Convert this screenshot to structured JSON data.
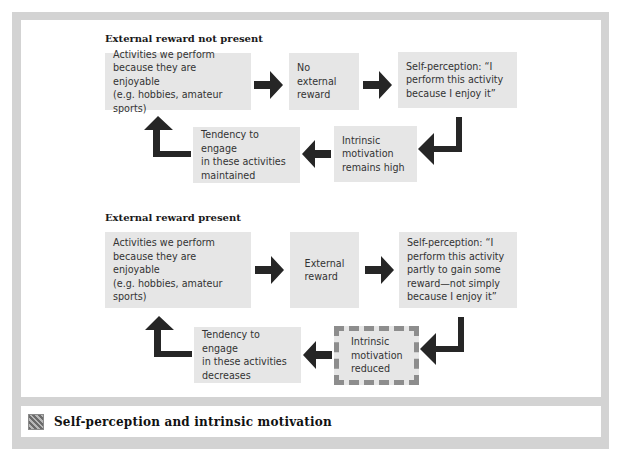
{
  "diagram": {
    "caption": {
      "icon": "photo-thumbnail-icon",
      "text": "Self-perception and intrinsic motivation"
    },
    "sections": [
      {
        "title": "External reward not present",
        "boxes": {
          "activities": [
            "Activities we perform",
            "because they are enjoyable",
            "(e.g. hobbies, amateur sports)"
          ],
          "reward": [
            "No external",
            "reward"
          ],
          "self_perception": [
            "Self-perception: “I",
            "perform this activity",
            "because I enjoy it”"
          ],
          "intrinsic": [
            "Intrinsic",
            "motivation",
            "remains high"
          ],
          "tendency": [
            "Tendency to engage",
            "in these activities",
            "maintained"
          ]
        }
      },
      {
        "title": "External reward present",
        "boxes": {
          "activities": [
            "Activities we perform",
            "because they are enjoyable",
            "(e.g. hobbies, amateur sports)"
          ],
          "reward": [
            "External",
            "reward"
          ],
          "self_perception": [
            "Self-perception: “I",
            "perform this activity",
            "partly to gain some",
            "reward—not simply",
            "because I enjoy it”"
          ],
          "intrinsic": [
            "Intrinsic",
            "motivation",
            "reduced"
          ],
          "tendency": [
            "Tendency to engage",
            "in these activities",
            "decreases"
          ]
        },
        "highlight": "intrinsic"
      }
    ],
    "colors": {
      "box_fill": "#e6e6e6",
      "arrow": "#262626",
      "frame": "#d3d3d3",
      "dashed_border": "#8d8d8d"
    }
  }
}
